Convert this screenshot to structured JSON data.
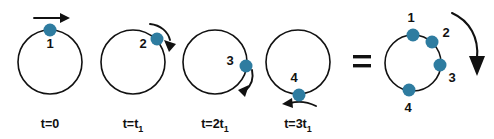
{
  "figure": {
    "title": "",
    "background_color": "#ffffff",
    "stroke_color": "#111111",
    "dot_color": "#2E7CA0",
    "equals_symbol": "=",
    "panels": [
      {
        "id": "panel-t0",
        "time_label_prefix": "t=0",
        "time_label_sub": "",
        "circle": {
          "cx": 50,
          "cy": 62,
          "r": 32
        },
        "dots": [
          {
            "label": "1",
            "angle_deg": 90,
            "label_dx": 0,
            "label_dy": 18
          }
        ],
        "arrow": {
          "type": "straight-right",
          "x1": 34,
          "y1": 18,
          "x2": 66,
          "y2": 18
        }
      },
      {
        "id": "panel-t1",
        "time_label_prefix": "t=t",
        "time_label_sub": "1",
        "circle": {
          "cx": 133,
          "cy": 62,
          "r": 32
        },
        "dots": [
          {
            "label": "2",
            "angle_deg": 42,
            "label_dx": -18,
            "label_dy": 7
          }
        ],
        "arrow": {
          "type": "curve-clockwise-upper",
          "x1": 152,
          "y1": 26,
          "x2": 172,
          "y2": 46
        }
      },
      {
        "id": "panel-t2",
        "time_label_prefix": "t=2t",
        "time_label_sub": "1",
        "circle": {
          "cx": 215,
          "cy": 62,
          "r": 32
        },
        "dots": [
          {
            "label": "3",
            "angle_deg": 3,
            "label_dx": -18,
            "label_dy": -2
          }
        ],
        "arrow": {
          "type": "curve-clockwise-right",
          "x1": 250,
          "y1": 66,
          "x2": 244,
          "y2": 92
        }
      },
      {
        "id": "panel-t3",
        "time_label_prefix": "t=3t",
        "time_label_sub": "1",
        "circle": {
          "cx": 298,
          "cy": 62,
          "r": 32
        },
        "dots": [
          {
            "label": "4",
            "angle_deg": -88,
            "label_dx": -4,
            "label_dy": -14
          }
        ],
        "arrow": {
          "type": "straight-left",
          "x1": 314,
          "y1": 104,
          "x2": 282,
          "y2": 104
        }
      }
    ],
    "summary_panel": {
      "id": "panel-summary",
      "circle": {
        "cx": 413,
        "cy": 63,
        "r": 28
      },
      "dots": [
        {
          "label": "1",
          "angle_deg": 90,
          "label_dx": -2,
          "label_dy": -14
        },
        {
          "label": "2",
          "angle_deg": 48,
          "label_dx": 14,
          "label_dy": -6
        },
        {
          "label": "3",
          "angle_deg": 0,
          "label_dx": 14,
          "label_dy": 15
        },
        {
          "label": "4",
          "angle_deg": -74,
          "label_dx": -2,
          "label_dy": 22
        }
      ],
      "rotation_arrow": {
        "path": "M 452 14 C 470 22 478 40 477 62",
        "head_x": 477,
        "head_y": 64
      }
    },
    "equals": {
      "x": 362,
      "y": 62
    }
  }
}
